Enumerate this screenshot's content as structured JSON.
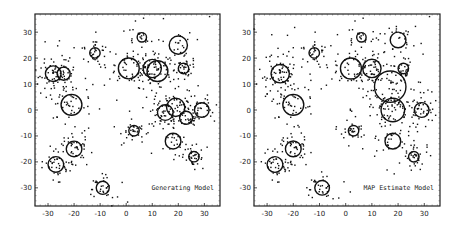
{
  "chart_data": [
    {
      "type": "scatter",
      "title": "",
      "annotation": "Generating Model",
      "annotation_position": "bottom-right",
      "xlabel": "",
      "ylabel": "",
      "xlim": [
        -35,
        36
      ],
      "ylim": [
        -37,
        37
      ],
      "xticks": [
        -30,
        -20,
        -10,
        0,
        10,
        20,
        30
      ],
      "yticks": [
        -30,
        -20,
        -10,
        0,
        10,
        20,
        30
      ],
      "grid": false,
      "clusters": [
        {
          "cx": -28,
          "cy": 14,
          "r": 3.0,
          "n": 45
        },
        {
          "cx": -24,
          "cy": 14,
          "r": 2.5,
          "n": 35
        },
        {
          "cx": -21,
          "cy": 2,
          "r": 4.0,
          "n": 40
        },
        {
          "cx": -12,
          "cy": 22,
          "r": 2.0,
          "n": 30
        },
        {
          "cx": -20,
          "cy": -15,
          "r": 3.0,
          "n": 45
        },
        {
          "cx": -27,
          "cy": -21,
          "r": 3.0,
          "n": 35
        },
        {
          "cx": -9,
          "cy": -30,
          "r": 2.5,
          "n": 30
        },
        {
          "cx": 1,
          "cy": 16,
          "r": 4.0,
          "n": 40
        },
        {
          "cx": 6,
          "cy": 28,
          "r": 1.8,
          "n": 20
        },
        {
          "cx": 10,
          "cy": 16,
          "r": 3.5,
          "n": 45
        },
        {
          "cx": 12,
          "cy": 15,
          "r": 4.0,
          "n": 35
        },
        {
          "cx": 20,
          "cy": 25,
          "r": 3.5,
          "n": 25
        },
        {
          "cx": 22,
          "cy": 16,
          "r": 2.0,
          "n": 30
        },
        {
          "cx": 3,
          "cy": -8,
          "r": 2.0,
          "n": 30
        },
        {
          "cx": 15,
          "cy": -1,
          "r": 3.0,
          "n": 40
        },
        {
          "cx": 19,
          "cy": 1,
          "r": 3.5,
          "n": 35
        },
        {
          "cx": 23,
          "cy": -3,
          "r": 2.5,
          "n": 25
        },
        {
          "cx": 29,
          "cy": 0,
          "r": 2.8,
          "n": 35
        },
        {
          "cx": 18,
          "cy": -12,
          "r": 3.0,
          "n": 25
        },
        {
          "cx": 26,
          "cy": -18,
          "r": 2.0,
          "n": 35
        }
      ],
      "outliers": [
        [
          32,
          36
        ],
        [
          -28,
          -27
        ],
        [
          -20,
          24
        ],
        [
          -34,
          10
        ]
      ]
    },
    {
      "type": "scatter",
      "title": "",
      "annotation": "MAP Estimate Model",
      "annotation_position": "bottom-right",
      "xlabel": "",
      "ylabel": "",
      "xlim": [
        -35,
        36
      ],
      "ylim": [
        -37,
        37
      ],
      "xticks": [
        -30,
        -20,
        -10,
        0,
        10,
        20,
        30
      ],
      "yticks": [
        -30,
        -20,
        -10,
        0,
        10,
        20,
        30
      ],
      "grid": false,
      "clusters": [
        {
          "cx": -25,
          "cy": 14,
          "r": 3.5,
          "n": 80
        },
        {
          "cx": -20,
          "cy": 2,
          "r": 4.0,
          "n": 40
        },
        {
          "cx": -12,
          "cy": 22,
          "r": 2.0,
          "n": 30
        },
        {
          "cx": -20,
          "cy": -15,
          "r": 3.0,
          "n": 45
        },
        {
          "cx": -27,
          "cy": -21,
          "r": 3.0,
          "n": 35
        },
        {
          "cx": -9,
          "cy": -30,
          "r": 2.8,
          "n": 30
        },
        {
          "cx": 2,
          "cy": 16,
          "r": 4.0,
          "n": 40
        },
        {
          "cx": 6,
          "cy": 28,
          "r": 1.8,
          "n": 20
        },
        {
          "cx": 10,
          "cy": 16,
          "r": 3.5,
          "n": 45
        },
        {
          "cx": 20,
          "cy": 27,
          "r": 3.0,
          "n": 25
        },
        {
          "cx": 22,
          "cy": 16,
          "r": 2.0,
          "n": 30
        },
        {
          "cx": 17,
          "cy": 9,
          "r": 6.0,
          "n": 45
        },
        {
          "cx": 3,
          "cy": -8,
          "r": 2.0,
          "n": 30
        },
        {
          "cx": 18,
          "cy": 0,
          "r": 4.5,
          "n": 70
        },
        {
          "cx": 29,
          "cy": 0,
          "r": 2.8,
          "n": 35
        },
        {
          "cx": 18,
          "cy": -12,
          "r": 3.0,
          "n": 25
        },
        {
          "cx": 26,
          "cy": -18,
          "r": 2.0,
          "n": 35
        }
      ],
      "outliers": [
        [
          32,
          36
        ],
        [
          -28,
          -27
        ],
        [
          -20,
          24
        ],
        [
          -34,
          10
        ]
      ]
    }
  ]
}
